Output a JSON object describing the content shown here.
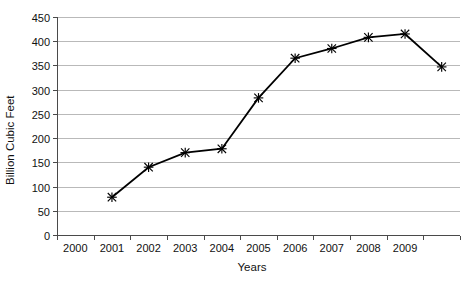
{
  "chart_data": {
    "type": "line",
    "title": "",
    "xlabel": "Years",
    "ylabel": "Billion Cubic Feet",
    "ylim": [
      0,
      450
    ],
    "ytick_step": 50,
    "yticks": [
      "0",
      "50",
      "100",
      "150",
      "200",
      "250",
      "300",
      "350",
      "400",
      "450"
    ],
    "categories": [
      "2000",
      "2001",
      "2002",
      "2003",
      "2004",
      "2005",
      "2006",
      "2007",
      "2008",
      "2009",
      ""
    ],
    "xtick_labels": [
      "2000",
      "2001",
      "2002",
      "2003",
      "2004",
      "2005",
      "2006",
      "2007",
      "2008",
      "2009"
    ],
    "grid": true,
    "grid_axis": "y",
    "legend": false,
    "legend_position": "none",
    "marker": "x",
    "line_color": "#000000",
    "grid_color": "#b9b9b9",
    "axis_color": "#4a4a4a",
    "background_color": "#ffffff",
    "series": [
      {
        "name": "Billion Cubic Feet",
        "points": [
          {
            "x": "2000",
            "y": null
          },
          {
            "x": "2001",
            "y": 78
          },
          {
            "x": "2002",
            "y": 140
          },
          {
            "x": "2003",
            "y": 170
          },
          {
            "x": "2004",
            "y": 178
          },
          {
            "x": "2005",
            "y": 283
          },
          {
            "x": "2006",
            "y": 365
          },
          {
            "x": "2007",
            "y": 385
          },
          {
            "x": "2008",
            "y": 408
          },
          {
            "x": "2009",
            "y": 415
          },
          {
            "x": "",
            "y": 347
          }
        ]
      }
    ]
  }
}
